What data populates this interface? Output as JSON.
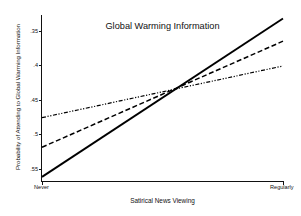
{
  "chart_data": {
    "type": "line",
    "title": "Global Warming Information",
    "xlabel": "Satirical News Viewing",
    "ylabel": "Probability of Attending to Global Warming Information",
    "grid": false,
    "legend": "none",
    "x": [
      0,
      1
    ],
    "xtick_labels": [
      "Never",
      "Regularly"
    ],
    "xlim": [
      0,
      1
    ],
    "ylim": [
      0.332,
      0.573
    ],
    "ytick_values": [
      0.35,
      0.4,
      0.45,
      0.5,
      0.55
    ],
    "ytick_labels": [
      ".35",
      ".4",
      ".45",
      ".5",
      ".55"
    ],
    "series": [
      {
        "name": "solid",
        "style": "solid",
        "color": "#000000",
        "values": [
          0.338,
          0.568
        ]
      },
      {
        "name": "dashed",
        "style": "dashed",
        "color": "#000000",
        "values": [
          0.381,
          0.535
        ]
      },
      {
        "name": "dash-dot-dot",
        "style": "dash-dot-dot",
        "color": "#000000",
        "values": [
          0.424,
          0.499
        ]
      }
    ],
    "annotations": []
  },
  "axes": {
    "x_tick_never": "Never",
    "x_tick_regularly": "Regularly",
    "y_tick_0": ".55",
    "y_tick_1": ".5",
    "y_tick_2": ".45",
    "y_tick_3": ".4",
    "y_tick_4": ".35"
  }
}
